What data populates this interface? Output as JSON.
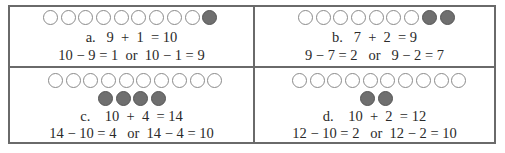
{
  "panels": [
    {
      "id": "a",
      "rows": [
        {
          "empty": 9,
          "filled": 1
        }
      ],
      "equation": "a.   9  +  1  = 10",
      "facts": "10 − 9 = 1  or  10 − 1 = 9"
    },
    {
      "id": "b",
      "rows": [
        {
          "empty": 7,
          "filled": 2
        }
      ],
      "equation": "b.   7  +  2  = 9",
      "facts": "9 − 7 = 2   or   9 − 2 = 7"
    },
    {
      "id": "c",
      "rows": [
        {
          "empty": 10,
          "filled": 0
        },
        {
          "empty": 0,
          "filled": 4
        }
      ],
      "equation": "c.    10  +  4  = 14",
      "facts": "14 − 10 = 4   or  14 − 4 = 10"
    },
    {
      "id": "d",
      "rows": [
        {
          "empty": 10,
          "filled": 0
        },
        {
          "empty": 0,
          "filled": 2
        }
      ],
      "equation": "d.    10  +  2  = 12",
      "facts": "12 − 10 = 2   or  12 − 2 = 10"
    }
  ],
  "colors": {
    "border": "#6a6a6a",
    "filled_circle": "#6f6f6f",
    "empty_circle_stroke": "#8a8a8a"
  }
}
